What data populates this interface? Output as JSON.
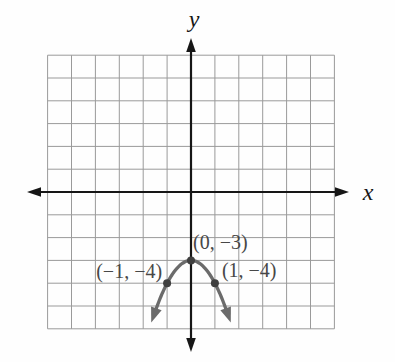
{
  "figure": {
    "background": "#fefefe",
    "axis_color": "#161616",
    "grid_color": "#9a9a9a",
    "curve_color": "#6b6b6b",
    "point_color": "#3f3f3f",
    "label_color": "#474747",
    "x_axis_label": "x",
    "y_axis_label": "y"
  },
  "chart_data": {
    "type": "line",
    "title": "",
    "equation": "y = -x^2 - 3",
    "grid": {
      "x_min": -6,
      "x_max": 6,
      "y_min": -6,
      "y_max": 6,
      "cells_x": 12,
      "cells_y": 12,
      "grid_on": true
    },
    "xlabel": "x",
    "ylabel": "y",
    "curve_domain": [
      -1.45,
      1.45
    ],
    "points": [
      {
        "label": "(0, −3)",
        "x": 0,
        "y": -3
      },
      {
        "label": "(−1, −4)",
        "x": -1,
        "y": -4
      },
      {
        "label": "(1, −4)",
        "x": 1,
        "y": -4
      }
    ]
  }
}
